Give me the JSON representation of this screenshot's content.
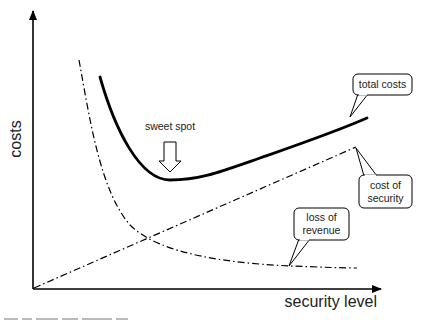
{
  "diagram": {
    "axes": {
      "x_label": "security level",
      "y_label": "costs"
    },
    "curves": [
      {
        "id": "total-costs",
        "label": "total costs",
        "style": "solid-thick"
      },
      {
        "id": "cost-of-security",
        "label": "cost of security",
        "style": "dash-dot"
      },
      {
        "id": "loss-of-revenue",
        "label": "loss of revenue",
        "style": "dash-dot"
      }
    ],
    "callouts": {
      "total_costs": {
        "line1": "total costs"
      },
      "cost_of_security": {
        "line1": "cost of",
        "line2": "security"
      },
      "loss_of_revenue": {
        "line1": "loss of",
        "line2": "revenue"
      }
    },
    "annotation": {
      "sweet_spot": "sweet spot"
    },
    "colors": {
      "ink": "#000000",
      "text": "#222222",
      "background": "#ffffff"
    }
  }
}
